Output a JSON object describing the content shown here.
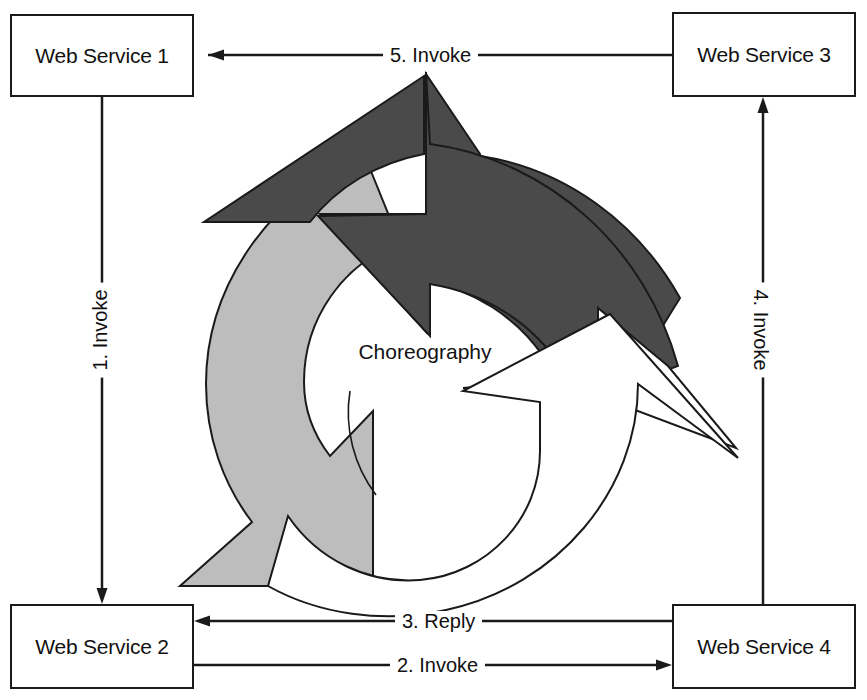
{
  "diagram": {
    "title": "Choreography",
    "center_label": "Choreography",
    "services": [
      {
        "id": "ws1",
        "label": "Web Service 1",
        "position": "top-left"
      },
      {
        "id": "ws3",
        "label": "Web Service 3",
        "position": "top-right"
      },
      {
        "id": "ws2",
        "label": "Web Service 2",
        "position": "bottom-left"
      },
      {
        "id": "ws4",
        "label": "Web Service 4",
        "position": "bottom-right"
      }
    ],
    "messages": [
      {
        "step": 1,
        "label": "1. Invoke",
        "from": "ws1",
        "to": "ws2",
        "direction": "down",
        "orientation": "vertical"
      },
      {
        "step": 2,
        "label": "2. Invoke",
        "from": "ws2",
        "to": "ws4",
        "direction": "right",
        "orientation": "horizontal"
      },
      {
        "step": 3,
        "label": "3. Reply",
        "from": "ws4",
        "to": "ws2",
        "direction": "left",
        "orientation": "horizontal"
      },
      {
        "step": 4,
        "label": "4. Invoke",
        "from": "ws4",
        "to": "ws3",
        "direction": "up",
        "orientation": "vertical"
      },
      {
        "step": 5,
        "label": "5. Invoke",
        "from": "ws3",
        "to": "ws1",
        "direction": "left",
        "orientation": "horizontal"
      }
    ],
    "wheel": {
      "segments": [
        {
          "name": "dark-arrow",
          "fill": "#4a4a4a",
          "stroke": "#1a1a1a"
        },
        {
          "name": "gray-arrow",
          "fill": "#bdbdbd",
          "stroke": "#1a1a1a"
        },
        {
          "name": "white-arrow",
          "fill": "#ffffff",
          "stroke": "#1a1a1a"
        }
      ]
    },
    "colors": {
      "line": "#1a1a1a",
      "box_border": "#1a1a1a",
      "background": "#ffffff",
      "dark_segment": "#4a4a4a",
      "gray_segment": "#bdbdbd",
      "white_segment": "#ffffff",
      "text": "#111111"
    }
  }
}
